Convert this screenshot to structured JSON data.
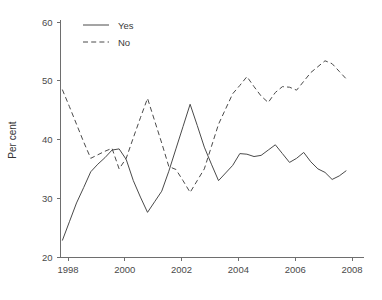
{
  "chart_data": {
    "type": "line",
    "title": "",
    "xlabel": "",
    "ylabel": "Per cent",
    "xlim": [
      1997.6,
      2007.95
    ],
    "ylim": [
      20,
      60
    ],
    "grid": false,
    "legend_position": "top-left",
    "xticks": [
      1998,
      2000,
      2002,
      2004,
      2006,
      2008
    ],
    "xtick_labels": [
      "1998",
      "2000",
      "2002",
      "2004",
      "2006",
      "2008"
    ],
    "yticks": [
      20,
      30,
      40,
      50,
      60
    ],
    "ytick_labels": [
      "20",
      "30",
      "40",
      "50",
      "60"
    ],
    "x": [
      1997.8,
      1998.05,
      1998.3,
      1998.55,
      1998.8,
      1999.05,
      1999.3,
      1999.55,
      1999.8,
      2000.05,
      2000.3,
      2000.55,
      2000.8,
      2001.05,
      2001.3,
      2001.55,
      2001.8,
      2002.05,
      2002.3,
      2002.55,
      2002.8,
      2003.05,
      2003.3,
      2003.55,
      2003.8,
      2004.05,
      2004.3,
      2004.55,
      2004.8,
      2005.05,
      2005.3,
      2005.55,
      2005.8,
      2006.05,
      2006.3,
      2006.55,
      2006.8,
      2007.05,
      2007.3,
      2007.55,
      2007.8
    ],
    "series": [
      {
        "name": "Yes",
        "style": "solid",
        "color": "#4a4a4a",
        "values": [
          22.8,
          26.0,
          29.2,
          31.8,
          34.5,
          35.8,
          36.9,
          38.2,
          38.4,
          36.6,
          33.0,
          30.2,
          27.6,
          29.4,
          31.2,
          34.6,
          38.4,
          42.2,
          46.0,
          42.4,
          38.7,
          35.8,
          33.0,
          34.3,
          35.6,
          37.6,
          37.5,
          37.1,
          37.3,
          38.2,
          39.1,
          37.6,
          36.1,
          36.8,
          37.8,
          36.2,
          35.0,
          34.4,
          33.2,
          33.8,
          34.7
        ]
      },
      {
        "name": "No",
        "style": "dashed",
        "color": "#4a4a4a",
        "values": [
          48.5,
          45.6,
          42.6,
          39.6,
          36.8,
          37.4,
          38.0,
          38.5,
          35.0,
          36.8,
          40.3,
          43.7,
          47.0,
          43.2,
          39.4,
          35.4,
          34.9,
          33.0,
          31.0,
          33.0,
          35.0,
          38.8,
          42.6,
          45.2,
          47.8,
          49.2,
          50.7,
          49.0,
          47.4,
          46.3,
          48.0,
          49.0,
          48.9,
          48.4,
          49.9,
          51.4,
          52.4,
          53.4,
          52.9,
          51.6,
          50.3
        ]
      }
    ]
  },
  "legend": {
    "entries": [
      {
        "label": "Yes",
        "style": "solid"
      },
      {
        "label": "No",
        "style": "dashed"
      }
    ]
  }
}
